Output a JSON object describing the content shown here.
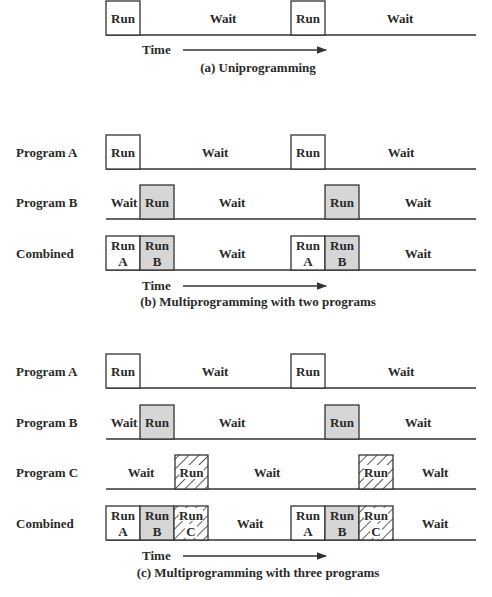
{
  "colors": {
    "line": "#333333",
    "run_b_fill": "#d6d6d6",
    "background": "#ffffff",
    "text": "#2a2a2a"
  },
  "panels": [
    {
      "id": "a",
      "caption": "(a) Uniprogramming",
      "time_label": "Time",
      "rows": [
        {
          "label": "",
          "baseline_y": 35,
          "boxes": [
            {
              "x": 106,
              "w": 34,
              "lines": [
                "Run"
              ],
              "fill": "plain"
            },
            {
              "x": 291,
              "w": 34,
              "lines": [
                "Run"
              ],
              "fill": "plain"
            }
          ],
          "texts": [
            {
              "x": 223,
              "text": "Wait"
            },
            {
              "x": 400,
              "text": "Wait"
            }
          ]
        }
      ],
      "time_y": 50,
      "caption_y": 72
    },
    {
      "id": "b",
      "caption": "(b) Multiprogramming with two programs",
      "time_label": "Time",
      "rows": [
        {
          "label": "Program A",
          "baseline_y": 169,
          "boxes": [
            {
              "x": 106,
              "w": 34,
              "lines": [
                "Run"
              ],
              "fill": "plain"
            },
            {
              "x": 291,
              "w": 34,
              "lines": [
                "Run"
              ],
              "fill": "plain"
            }
          ],
          "texts": [
            {
              "x": 215,
              "text": "Wait"
            },
            {
              "x": 401,
              "text": "Wait"
            }
          ]
        },
        {
          "label": "Program B",
          "baseline_y": 219,
          "boxes": [
            {
              "x": 140,
              "w": 34,
              "lines": [
                "Run"
              ],
              "fill": "gray"
            },
            {
              "x": 325,
              "w": 34,
              "lines": [
                "Run"
              ],
              "fill": "gray"
            }
          ],
          "texts": [
            {
              "x": 124,
              "text": "Wait"
            },
            {
              "x": 232,
              "text": "Wait"
            },
            {
              "x": 418,
              "text": "Wait"
            }
          ]
        },
        {
          "label": "Combined",
          "baseline_y": 270,
          "boxes": [
            {
              "x": 106,
              "w": 34,
              "lines": [
                "Run",
                "A"
              ],
              "fill": "plain"
            },
            {
              "x": 140,
              "w": 34,
              "lines": [
                "Run",
                "B"
              ],
              "fill": "gray"
            },
            {
              "x": 291,
              "w": 34,
              "lines": [
                "Run",
                "A"
              ],
              "fill": "plain"
            },
            {
              "x": 325,
              "w": 34,
              "lines": [
                "Run",
                "B"
              ],
              "fill": "gray"
            }
          ],
          "texts": [
            {
              "x": 232,
              "text": "Wait"
            },
            {
              "x": 418,
              "text": "Wait"
            }
          ]
        }
      ],
      "time_y": 286,
      "caption_y": 306
    },
    {
      "id": "c",
      "caption": "(c) Multiprogramming with three programs",
      "time_label": "Time",
      "rows": [
        {
          "label": "Program A",
          "baseline_y": 388,
          "boxes": [
            {
              "x": 106,
              "w": 34,
              "lines": [
                "Run"
              ],
              "fill": "plain"
            },
            {
              "x": 291,
              "w": 34,
              "lines": [
                "Run"
              ],
              "fill": "plain"
            }
          ],
          "texts": [
            {
              "x": 215,
              "text": "Wait"
            },
            {
              "x": 401,
              "text": "Wait"
            }
          ]
        },
        {
          "label": "Program B",
          "baseline_y": 439,
          "boxes": [
            {
              "x": 140,
              "w": 34,
              "lines": [
                "Run"
              ],
              "fill": "gray"
            },
            {
              "x": 325,
              "w": 34,
              "lines": [
                "Run"
              ],
              "fill": "gray"
            }
          ],
          "texts": [
            {
              "x": 124,
              "text": "Wait"
            },
            {
              "x": 232,
              "text": "Wait"
            },
            {
              "x": 418,
              "text": "Wait"
            }
          ]
        },
        {
          "label": "Program C",
          "baseline_y": 489,
          "boxes": [
            {
              "x": 175,
              "w": 33,
              "lines": [
                "Run"
              ],
              "fill": "hatch"
            },
            {
              "x": 359,
              "w": 34,
              "lines": [
                "Run"
              ],
              "fill": "hatch"
            }
          ],
          "texts": [
            {
              "x": 141,
              "text": "Wait"
            },
            {
              "x": 267,
              "text": "Wait"
            },
            {
              "x": 435,
              "text": "Walt"
            }
          ]
        },
        {
          "label": "Combined",
          "baseline_y": 540,
          "boxes": [
            {
              "x": 106,
              "w": 34,
              "lines": [
                "Run",
                "A"
              ],
              "fill": "plain"
            },
            {
              "x": 140,
              "w": 34,
              "lines": [
                "Run",
                "B"
              ],
              "fill": "gray"
            },
            {
              "x": 174,
              "w": 34,
              "lines": [
                "Run",
                "C"
              ],
              "fill": "hatch"
            },
            {
              "x": 291,
              "w": 34,
              "lines": [
                "Run",
                "A"
              ],
              "fill": "plain"
            },
            {
              "x": 325,
              "w": 34,
              "lines": [
                "Run",
                "B"
              ],
              "fill": "gray"
            },
            {
              "x": 359,
              "w": 34,
              "lines": [
                "Run",
                "C"
              ],
              "fill": "hatch"
            }
          ],
          "texts": [
            {
              "x": 250,
              "text": "Wait"
            },
            {
              "x": 435,
              "text": "Wait"
            }
          ]
        }
      ],
      "time_y": 556,
      "caption_y": 577
    }
  ],
  "layout": {
    "line_x1": 106,
    "line_x2": 476,
    "box_h": 34,
    "label_x": 16,
    "time_x": 142,
    "arrow_x1": 183,
    "arrow_x2": 326,
    "caption_cx": 258
  }
}
